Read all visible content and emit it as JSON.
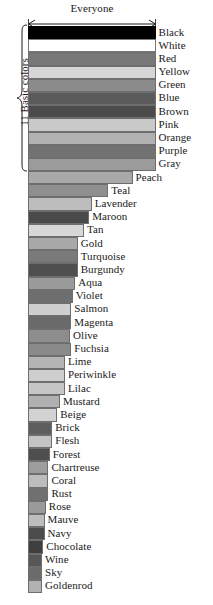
{
  "chart_data": {
    "type": "bar",
    "orientation": "horizontal",
    "title": "",
    "xlabel": "Everyone",
    "ylabel": "",
    "axis_annotation": "Everyone",
    "group_annotation": "11 Basic colors",
    "group_size": 11,
    "grid": false,
    "legend": "none",
    "xlim": [
      0,
      100
    ],
    "categories": [
      "Black",
      "White",
      "Red",
      "Yellow",
      "Green",
      "Blue",
      "Brown",
      "Pink",
      "Orange",
      "Purple",
      "Gray",
      "Peach",
      "Teal",
      "Lavender",
      "Maroon",
      "Tan",
      "Gold",
      "Turquoise",
      "Burgundy",
      "Aqua",
      "Violet",
      "Salmon",
      "Magenta",
      "Olive",
      "Fuchsia",
      "Lime",
      "Periwinkle",
      "Lilac",
      "Mustard",
      "Beige",
      "Brick",
      "Flesh",
      "Forest",
      "Chartreuse",
      "Coral",
      "Rust",
      "Rose",
      "Mauve",
      "Navy",
      "Chocolate",
      "Wine",
      "Sky",
      "Goldenrod"
    ],
    "values": [
      100,
      100,
      100,
      100,
      100,
      100,
      100,
      100,
      100,
      100,
      100,
      82,
      63,
      50,
      48,
      44,
      39,
      39,
      39,
      37,
      35,
      34,
      34,
      33,
      34,
      29,
      29,
      29,
      25,
      23,
      19,
      19,
      17,
      16,
      16,
      16,
      14,
      13,
      13,
      12,
      11,
      11,
      11
    ],
    "bar_fills": [
      "#000000",
      "#ffffff",
      "#787878",
      "#d6d6d6",
      "#8b8b8b",
      "#5b5b5b",
      "#4b4b4b",
      "#c9c9c9",
      "#b1b1b1",
      "#727272",
      "#9b9b9b",
      "#a9a9a9",
      "#8f8f8f",
      "#bdbdbd",
      "#4a4a4a",
      "#d8d8d8",
      "#a8a8a8",
      "#7a7a7a",
      "#4f4f4f",
      "#9a9a9a",
      "#6e6e6e",
      "#cfcfcf",
      "#6a6a6a",
      "#8d8d8d",
      "#8a8a8a",
      "#b4b4b4",
      "#cecece",
      "#c6c6c6",
      "#b0b0b0",
      "#d2d2d2",
      "#5e5e5e",
      "#c4c4c4",
      "#4e4e4e",
      "#9d9d9d",
      "#bcbcbc",
      "#707070",
      "#9a9a9a",
      "#bdbdbd",
      "#4c4c4c",
      "#3f3f3f",
      "#575757",
      "#6b6b6b",
      "#b2b2b2"
    ]
  }
}
